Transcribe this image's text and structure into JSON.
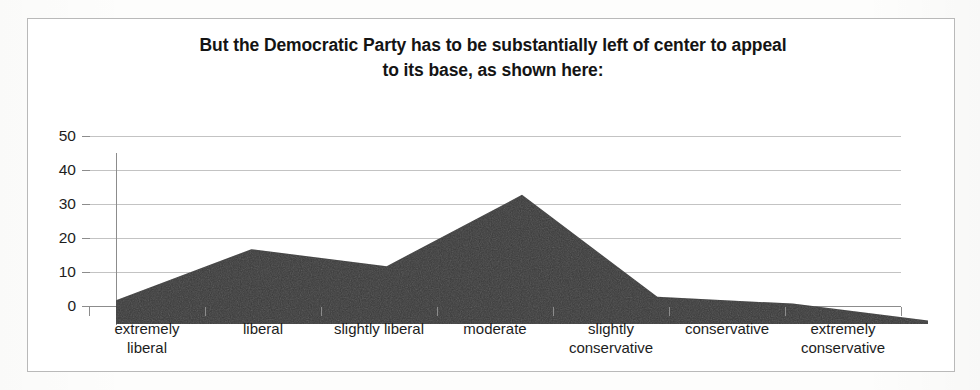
{
  "title": {
    "line1": "But the Democratic Party has to be substantially left of center to appeal",
    "line2": "to its base, as shown here:"
  },
  "colors": {
    "area_fill": "#3a3a3a",
    "gridline": "#c3c3c3",
    "axis": "#8c8c8c",
    "frame": "#b9b9b9",
    "text": "#1d1d1d",
    "page_background": "#fdfdfc"
  },
  "chart_data": {
    "type": "area",
    "title": "But the Democratic Party has to be substantially left of center to appeal to its base, as shown here:",
    "xlabel": "",
    "ylabel": "",
    "categories": [
      "extremely liberal",
      "liberal",
      "slightly liberal",
      "moderate",
      "slightly conservative",
      "conservative",
      "extremely conservative"
    ],
    "category_lines": [
      [
        "extremely",
        "liberal"
      ],
      [
        "liberal",
        ""
      ],
      [
        "slightly liberal",
        ""
      ],
      [
        "moderate",
        ""
      ],
      [
        "slightly",
        "conservative"
      ],
      [
        "conservative",
        ""
      ],
      [
        "extremely",
        "conservative"
      ]
    ],
    "values": [
      7,
      22,
      17,
      38,
      8,
      6,
      1
    ],
    "ylim": [
      0,
      50
    ],
    "ytick_labels": [
      "50",
      "40",
      "30",
      "20",
      "10",
      "0"
    ],
    "ytick_values": [
      50,
      40,
      30,
      20,
      10,
      0
    ],
    "grid": true,
    "legend": "none",
    "series": [
      {
        "name": "Democratic base ideology distribution",
        "values": [
          7,
          22,
          17,
          38,
          8,
          6,
          1
        ]
      }
    ]
  }
}
